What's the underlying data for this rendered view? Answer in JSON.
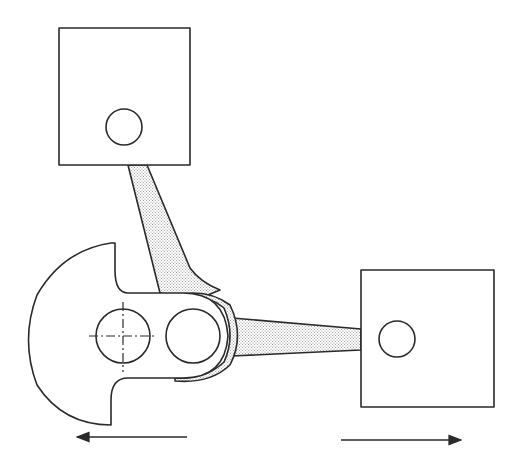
{
  "diagram": {
    "colors": {
      "line": "#2a2a2a",
      "stipple": "#9a9a9a",
      "background": "#ffffff"
    },
    "components": [
      {
        "id": "top-block",
        "type": "slider-block",
        "x": 59,
        "y": 28,
        "w": 131,
        "h": 137,
        "pin": {
          "cx": 124,
          "cy": 127,
          "r": 18
        }
      },
      {
        "id": "right-block",
        "type": "slider-block",
        "x": 361,
        "y": 270,
        "w": 133,
        "h": 137,
        "pin": {
          "cx": 397,
          "cy": 339,
          "r": 18
        }
      },
      {
        "id": "crank",
        "type": "crank-disc",
        "pivot": {
          "cx": 123,
          "cy": 336,
          "r": 27
        },
        "crank-pin": {
          "cx": 193,
          "cy": 336,
          "r": 27
        }
      },
      {
        "id": "upper-rod",
        "type": "connecting-rod",
        "stippled": true
      },
      {
        "id": "lower-rod",
        "type": "connecting-rod",
        "stippled": true
      }
    ],
    "arrows": [
      {
        "id": "arrow-left",
        "direction": "left",
        "x1": 187,
        "y1": 437,
        "x2": 75,
        "y2": 437
      },
      {
        "id": "arrow-right",
        "direction": "right",
        "x1": 341,
        "y1": 440,
        "x2": 463,
        "y2": 440
      }
    ]
  }
}
